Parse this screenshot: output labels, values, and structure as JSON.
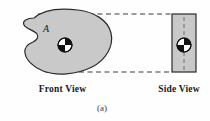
{
  "figure": {
    "caption": "(a)",
    "body_label": "A",
    "front_view_label": "Front View",
    "side_view_label": "Side View",
    "colors": {
      "body_fill": "#c9c9c9",
      "body_outline": "#2b2b2b",
      "rect_fill": "#c9c9c9",
      "rect_outline": "#2b2b2b",
      "dashed_line": "#3a3a3a",
      "centerline": "#6e6e6e",
      "marker_dark": "#111111",
      "marker_light": "#ffffff",
      "background": "#fefefe",
      "text": "#1a1a1a"
    },
    "front_view": {
      "name": "irregular-body-outline",
      "center_of_gravity": {
        "x": 65,
        "y": 45,
        "radius": 7
      },
      "label_position": {
        "x": 46,
        "y": 32
      },
      "outline_path": "M 34 18 C 44 9, 62 8, 78 10 C 94 12, 108 20, 111 33 C 114 46, 106 60, 92 67 C 76 75, 56 76, 43 71 C 33 67, 26 60, 25 53 C 24 47, 28 44, 33 42 C 37 40, 39 37, 37 34 C 34 30, 26 29, 24 25 C 22 21, 27 18, 34 18 Z"
    },
    "side_view": {
      "name": "side-view-rectangle",
      "x": 172,
      "y": 14,
      "width": 24,
      "height": 58,
      "center_of_gravity": {
        "x": 184,
        "y": 45,
        "radius": 7
      },
      "centerline": {
        "x": 184,
        "y1": 17,
        "y2": 70
      }
    },
    "projection_lines": [
      {
        "name": "top-projection-line",
        "x1": 38,
        "y1": 14,
        "x2": 172,
        "y2": 14
      },
      {
        "name": "bottom-projection-line",
        "x1": 45,
        "y1": 72,
        "x2": 172,
        "y2": 72
      }
    ]
  }
}
